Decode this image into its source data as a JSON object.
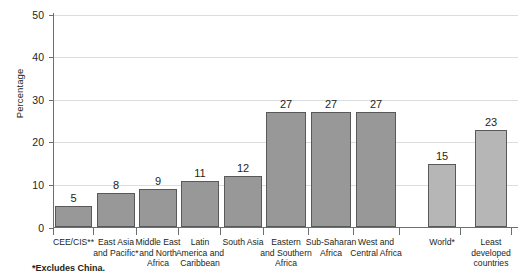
{
  "chart_data": {
    "type": "bar",
    "title": "",
    "xlabel": "",
    "ylabel": "Percentage",
    "ylim": [
      0,
      50
    ],
    "yticks": [
      0,
      10,
      20,
      30,
      40,
      50
    ],
    "grid": true,
    "legend": null,
    "categories": [
      "CEE/CIS**",
      "East Asia and Pacific*",
      "Middle East and North Africa",
      "Latin America and Caribbean",
      "South Asia",
      "Eastern and Southern Africa",
      "Sub-Saharan Africa",
      "West and Central Africa",
      "World*",
      "Least developed countries"
    ],
    "values": [
      5,
      8,
      9,
      11,
      12,
      27,
      27,
      27,
      15,
      23
    ],
    "annotations": [
      "*Excludes China."
    ]
  },
  "axis": {
    "y_title": "Percentage",
    "y_ticks": [
      {
        "label": "50",
        "value": 50
      },
      {
        "label": "40",
        "value": 40
      },
      {
        "label": "30",
        "value": 30
      },
      {
        "label": "20",
        "value": 20
      },
      {
        "label": "10",
        "value": 10
      },
      {
        "label": "0",
        "value": 0
      }
    ]
  },
  "bars": [
    {
      "label_lines": [
        "CEE/CIS**"
      ],
      "value": 5,
      "value_label": "5",
      "shade": "dark"
    },
    {
      "label_lines": [
        "East Asia",
        "and Pacific*"
      ],
      "value": 8,
      "value_label": "8",
      "shade": "dark"
    },
    {
      "label_lines": [
        "Middle East",
        "and North",
        "Africa"
      ],
      "value": 9,
      "value_label": "9",
      "shade": "dark"
    },
    {
      "label_lines": [
        "Latin",
        "America and",
        "Caribbean"
      ],
      "value": 11,
      "value_label": "11",
      "shade": "dark"
    },
    {
      "label_lines": [
        "South Asia"
      ],
      "value": 12,
      "value_label": "12",
      "shade": "dark"
    },
    {
      "label_lines": [
        "Eastern",
        "and Southern",
        "Africa"
      ],
      "value": 27,
      "value_label": "27",
      "shade": "dark"
    },
    {
      "label_lines": [
        "Sub-Saharan",
        "Africa"
      ],
      "value": 27,
      "value_label": "27",
      "shade": "dark"
    },
    {
      "label_lines": [
        "West and",
        "Central Africa"
      ],
      "value": 27,
      "value_label": "27",
      "shade": "dark"
    },
    {
      "label_lines": [
        "World*"
      ],
      "value": 15,
      "value_label": "15",
      "shade": "light"
    },
    {
      "label_lines": [
        "Least",
        "developed",
        "countries"
      ],
      "value": 23,
      "value_label": "23",
      "shade": "light"
    }
  ],
  "footnote": "*Excludes China.",
  "colors": {
    "bar_dark": "#989898",
    "bar_light": "#b6b6b6",
    "bar_outline": "#58595b",
    "gridline": "#dcdddf",
    "axis": "#6d6e71",
    "text": "#231f20",
    "background": "#ffffff"
  }
}
